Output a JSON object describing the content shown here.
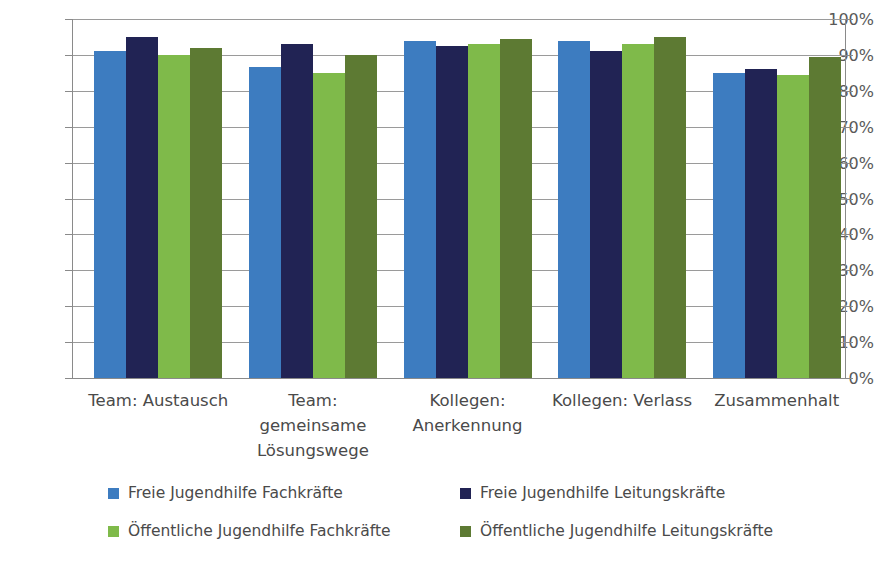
{
  "chart_data": {
    "type": "bar",
    "title": "",
    "subtitle": "",
    "xlabel": "",
    "ylabel": "",
    "ylim": [
      0,
      100
    ],
    "y_tick_labels": [
      "0%",
      "10%",
      "20%",
      "30%",
      "40%",
      "50%",
      "60%",
      "70%",
      "80%",
      "90%",
      "100%"
    ],
    "y_tick_values": [
      0,
      10,
      20,
      30,
      40,
      50,
      60,
      70,
      80,
      90,
      100
    ],
    "grid": "horizontal",
    "legend_position": "bottom",
    "categories": [
      "Team: Austausch",
      "Team: gemeinsame Lösungswege",
      "Kollegen: Anerkennung",
      "Kollegen: Verlass",
      "Zusammenhalt"
    ],
    "category_lines": [
      [
        "Team: Austausch"
      ],
      [
        "Team:",
        "gemeinsame",
        "Lösungswege"
      ],
      [
        "Kollegen:",
        "Anerkennung"
      ],
      [
        "Kollegen: Verlass"
      ],
      [
        "Zusammenhalt"
      ]
    ],
    "series": [
      {
        "name": "Freie Jugendhilfe Fachkräfte",
        "color": "#3d7cc0",
        "values": [
          91,
          86.5,
          94,
          94,
          85
        ]
      },
      {
        "name": "Freie Jugendhilfe Leitungskräfte",
        "color": "#212354",
        "values": [
          95,
          93,
          92.5,
          91,
          86
        ]
      },
      {
        "name": "Öffentliche Jugendhilfe Fachkräfte",
        "color": "#7fba4a",
        "values": [
          90,
          85,
          93,
          93,
          84.5
        ]
      },
      {
        "name": "Öffentliche Jugendhilfe Leitungskräfte",
        "color": "#5d7a33",
        "values": [
          92,
          90,
          94.5,
          95,
          89.5
        ]
      }
    ]
  },
  "legend": {
    "items": [
      {
        "label": "Freie Jugendhilfe Fachkräfte",
        "color": "#3d7cc0"
      },
      {
        "label": "Freie Jugendhilfe Leitungskräfte",
        "color": "#212354"
      },
      {
        "label": "Öffentliche Jugendhilfe Fachkräfte",
        "color": "#7fba4a"
      },
      {
        "label": "Öffentliche Jugendhilfe Leitungskräfte",
        "color": "#5d7a33"
      }
    ]
  }
}
